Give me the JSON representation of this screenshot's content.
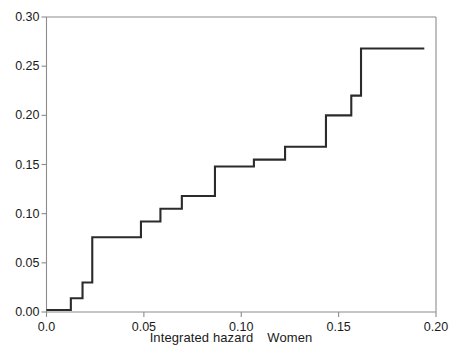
{
  "figure": {
    "background_color": "#ffffff",
    "line_color": "#2b2b2b",
    "axis_color": "#8c8c8c"
  },
  "axes": {
    "x_title_part1": "Integrated hazard",
    "x_title_part2": "Women",
    "x_ticks": [
      "0.0",
      "0.05",
      "0.10",
      "0.15",
      "0.20"
    ],
    "y_ticks": [
      "0.00",
      "0.05",
      "0.10",
      "0.15",
      "0.20",
      "0.25",
      "0.30"
    ]
  },
  "chart_data": {
    "type": "line",
    "title": "",
    "subtitle": "",
    "xlabel": "Integrated hazard   Women",
    "ylabel": "",
    "xlim": [
      0.0,
      0.2
    ],
    "ylim": [
      0.0,
      0.3
    ],
    "xticks": [
      0.0,
      0.05,
      0.1,
      0.15,
      0.2
    ],
    "xticklabels": [
      "0.0",
      "0.05",
      "0.10",
      "0.15",
      "0.20"
    ],
    "yticks": [
      0.0,
      0.05,
      0.1,
      0.15,
      0.2,
      0.25,
      0.3
    ],
    "yticklabels": [
      "0.00",
      "0.05",
      "0.10",
      "0.15",
      "0.20",
      "0.25",
      "0.30"
    ],
    "grid": false,
    "legend": null,
    "drawstyle": "steps-post",
    "series": [
      {
        "name": "Cumulative hazard (Women)",
        "x": [
          0.0,
          0.0075,
          0.0125,
          0.0185,
          0.0235,
          0.0485,
          0.0585,
          0.0695,
          0.0865,
          0.1065,
          0.1225,
          0.1315,
          0.1435,
          0.1565,
          0.194
        ],
        "y": [
          0.002,
          0.002,
          0.014,
          0.03,
          0.076,
          0.076,
          0.092,
          0.105,
          0.118,
          0.148,
          0.155,
          0.168,
          0.2,
          0.22,
          0.268
        ],
        "steps": [
          {
            "x_start": 0.0,
            "x_end": 0.0125,
            "y": 0.002
          },
          {
            "x_start": 0.0125,
            "x_end": 0.0185,
            "y": 0.014
          },
          {
            "x_start": 0.0185,
            "x_end": 0.0235,
            "y": 0.03
          },
          {
            "x_start": 0.0235,
            "x_end": 0.0485,
            "y": 0.076
          },
          {
            "x_start": 0.0485,
            "x_end": 0.0585,
            "y": 0.092
          },
          {
            "x_start": 0.0585,
            "x_end": 0.0695,
            "y": 0.105
          },
          {
            "x_start": 0.0695,
            "x_end": 0.0865,
            "y": 0.118
          },
          {
            "x_start": 0.0865,
            "x_end": 0.1065,
            "y": 0.148
          },
          {
            "x_start": 0.1065,
            "x_end": 0.1225,
            "y": 0.155
          },
          {
            "x_start": 0.1225,
            "x_end": 0.1435,
            "y": 0.168
          },
          {
            "x_start": 0.1435,
            "x_end": 0.1565,
            "y": 0.2
          },
          {
            "x_start": 0.1565,
            "x_end": 0.1615,
            "y": 0.22
          },
          {
            "x_start": 0.1615,
            "x_end": 0.194,
            "y": 0.268
          }
        ]
      }
    ]
  }
}
